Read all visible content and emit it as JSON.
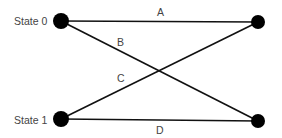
{
  "diagram": {
    "states": [
      {
        "id": "s0",
        "label": "State 0"
      },
      {
        "id": "s1",
        "label": "State 1"
      }
    ],
    "nodes": [
      {
        "id": "s0-left"
      },
      {
        "id": "s0-right"
      },
      {
        "id": "s1-left"
      },
      {
        "id": "s1-right"
      }
    ],
    "edges": [
      {
        "id": "A",
        "label": "A",
        "from": "s0-left",
        "to": "s0-right"
      },
      {
        "id": "B",
        "label": "B",
        "from": "s0-left",
        "to": "s1-right"
      },
      {
        "id": "C",
        "label": "C",
        "from": "s1-left",
        "to": "s0-right"
      },
      {
        "id": "D",
        "label": "D",
        "from": "s1-left",
        "to": "s1-right"
      }
    ],
    "colors": {
      "node": "#000000",
      "edge": "#111111",
      "text": "#444444"
    }
  }
}
